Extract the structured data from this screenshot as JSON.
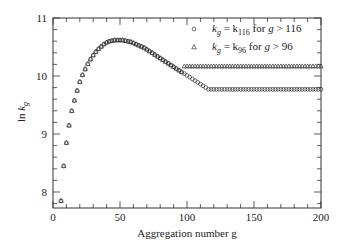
{
  "chart_data": {
    "type": "scatter",
    "title": "",
    "xlabel": "Aggregation number g",
    "ylabel": "ln k_g",
    "xlim": [
      0,
      200
    ],
    "ylim": [
      7.7,
      11
    ],
    "x_ticks": [
      0,
      50,
      100,
      150,
      200
    ],
    "y_ticks": [
      8,
      9,
      10,
      11
    ],
    "grid": false,
    "legend_position": "top-right",
    "series": [
      {
        "name": "k_g = k_116 for g > 116",
        "marker": "circle",
        "description": "Rises from ~7.85 at g=6 to peak ~10.62 near g=50, decreases, then constant ~9.77 for g > 116",
        "plateau_start": 116,
        "plateau_value": 9.77
      },
      {
        "name": "k_g = k_96 for g > 96",
        "marker": "triangle",
        "description": "Same as circles up to g=96, then constant ~10.17 for g > 96",
        "plateau_start": 96,
        "plateau_value": 10.17
      }
    ],
    "shared_curve": {
      "x": [
        6,
        8,
        10,
        12,
        14,
        16,
        18,
        20,
        22,
        24,
        26,
        28,
        30,
        32,
        34,
        36,
        38,
        40,
        42,
        44,
        46,
        48,
        50,
        52,
        54,
        56,
        58,
        60,
        62,
        64,
        66,
        68,
        70,
        72,
        74,
        76,
        78,
        80,
        82,
        84,
        86,
        88,
        90,
        92,
        94,
        96,
        98,
        100,
        102,
        104,
        106,
        108,
        110,
        112,
        114,
        116
      ],
      "y": [
        7.85,
        8.45,
        8.85,
        9.15,
        9.4,
        9.58,
        9.75,
        9.9,
        10.02,
        10.12,
        10.21,
        10.29,
        10.36,
        10.42,
        10.47,
        10.51,
        10.55,
        10.58,
        10.6,
        10.61,
        10.62,
        10.62,
        10.62,
        10.62,
        10.61,
        10.6,
        10.59,
        10.57,
        10.55,
        10.53,
        10.51,
        10.49,
        10.46,
        10.43,
        10.4,
        10.37,
        10.34,
        10.31,
        10.28,
        10.25,
        10.22,
        10.19,
        10.16,
        10.13,
        10.1,
        10.07,
        10.04,
        10.01,
        9.98,
        9.95,
        9.92,
        9.89,
        9.86,
        9.83,
        9.8,
        9.77
      ]
    },
    "legend": [
      {
        "marker": "circle",
        "label_main": "k",
        "label_sub": "g",
        "label_rest": " = k",
        "label_sub2": "116",
        "label_tail": " for g > 116"
      },
      {
        "marker": "triangle",
        "label_main": "k",
        "label_sub": "g",
        "label_rest": " = k",
        "label_sub2": "96",
        "label_tail": " for g > 96"
      }
    ]
  }
}
